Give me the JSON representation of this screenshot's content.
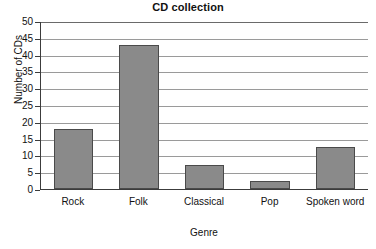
{
  "chart_data": {
    "type": "bar",
    "title": "CD collection",
    "xlabel": "Genre",
    "ylabel": "Number of CDs",
    "categories": [
      "Rock",
      "Folk",
      "Classical",
      "Pop",
      "Spoken word"
    ],
    "values": [
      18,
      43,
      7,
      2.5,
      12.5
    ],
    "series": [
      {
        "name": "Number of CDs",
        "values": [
          18,
          43,
          7,
          2.5,
          12.5
        ]
      }
    ],
    "ylim": [
      0,
      50
    ],
    "ytick_step": 5,
    "yticks": [
      0,
      5,
      10,
      15,
      20,
      25,
      30,
      35,
      40,
      45,
      50
    ],
    "ytick_labels": [
      "0",
      "5",
      "10",
      "15",
      "20",
      "25",
      "30",
      "35",
      "40",
      "45",
      "50"
    ],
    "xlim_categories": 5,
    "grid": "horizontal",
    "legend": "none",
    "bar_color": "#8a8a8a",
    "bar_border_color": "#4a4a4a",
    "axis_color": "#3c3c3c",
    "gridline_color": "#9a9a9a",
    "background_color": "#ffffff",
    "text_color": "#111111"
  }
}
